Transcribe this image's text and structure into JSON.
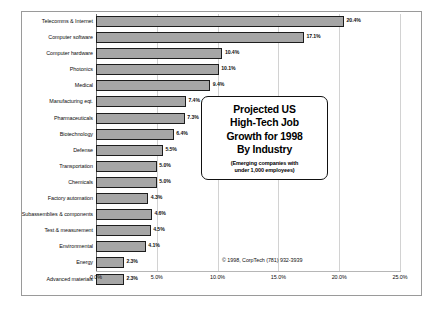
{
  "chart_data": {
    "type": "bar",
    "orientation": "horizontal",
    "title": "Projected US High-Tech Job Growth for 1998 By Industry",
    "subtitle": "(Emerging companies with under 1,000 employees)",
    "xlabel": "",
    "ylabel": "",
    "xlim": [
      0,
      25
    ],
    "grid": true,
    "legend": "none",
    "categories": [
      "Telecomms & Internet",
      "Computer software",
      "Computer hardware",
      "Photonics",
      "Medical",
      "Manufacturing eqt.",
      "Pharmaceuticals",
      "Biotechnology",
      "Defense",
      "Transportation",
      "Chemicals",
      "Factory automation",
      "Subassemblies & components",
      "Test & measurement",
      "Environmental",
      "Energy",
      "Advanced materials"
    ],
    "values": [
      20.4,
      17.1,
      10.4,
      10.1,
      9.4,
      7.4,
      7.3,
      6.4,
      5.5,
      5.0,
      5.0,
      4.3,
      4.6,
      4.5,
      4.1,
      2.3,
      2.3
    ],
    "value_labels": [
      "20.4%",
      "17.1%",
      "10.4%",
      "10.1%",
      "9.4%",
      "7.4%",
      "7.3%",
      "6.4%",
      "5.5%",
      "5.0%",
      "5.0%",
      "4.3%",
      "4.6%",
      "4.5%",
      "4.1%",
      "2.3%",
      "2.3%"
    ],
    "xticks": [
      0,
      5,
      10,
      15,
      20,
      25
    ],
    "xtick_labels": [
      "0.0%",
      "5.0%",
      "10.0%",
      "15.0%",
      "20.0%",
      "25.0%"
    ],
    "bar_color": "#a6a6a6",
    "bar_edge_color": "#1d1d1d"
  },
  "callout": {
    "line1": "Projected US",
    "line2": "High-Tech Job",
    "line3": "Growth for 1998",
    "line4": "By Industry",
    "sub_line1": "(Emerging companies with",
    "sub_line2": "under 1,000 employees)"
  },
  "copyright": "© 1998, CorpTech (781) 932-3939"
}
